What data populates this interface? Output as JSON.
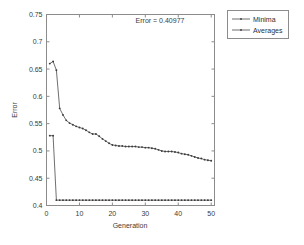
{
  "chart_data": {
    "type": "line",
    "title": "",
    "xlabel": "Generation",
    "ylabel": "Error",
    "xlim": [
      0,
      51
    ],
    "ylim": [
      0.4,
      0.75
    ],
    "xticks": [
      0,
      10,
      20,
      30,
      40,
      50
    ],
    "xtick_labels": [
      "0",
      "10",
      "20",
      "30",
      "40",
      "50"
    ],
    "yticks": [
      0.4,
      0.45,
      0.5,
      0.55,
      0.6,
      0.65,
      0.7,
      0.75
    ],
    "ytick_labels": [
      "0.4",
      "0.45",
      "0.5",
      "0.55",
      "0.6",
      "0.65",
      "0.7",
      "0.75"
    ],
    "grid": false,
    "legend_position": "outside-top-right",
    "annotations": [
      {
        "text": "Error = 0.40977",
        "x": 22,
        "y": 0.738
      }
    ],
    "x": [
      1,
      2,
      3,
      4,
      5,
      6,
      7,
      8,
      9,
      10,
      11,
      12,
      13,
      14,
      15,
      16,
      17,
      18,
      19,
      20,
      21,
      22,
      23,
      24,
      25,
      26,
      27,
      28,
      29,
      30,
      31,
      32,
      33,
      34,
      35,
      36,
      37,
      38,
      39,
      40,
      41,
      42,
      43,
      44,
      45,
      46,
      47,
      48,
      49,
      50
    ],
    "series": [
      {
        "name": "Minima",
        "marker": "point",
        "values": [
          0.528,
          0.528,
          0.4098,
          0.4098,
          0.4098,
          0.4098,
          0.4098,
          0.4098,
          0.4098,
          0.4098,
          0.4098,
          0.4098,
          0.4098,
          0.4098,
          0.4098,
          0.4098,
          0.4098,
          0.4098,
          0.4098,
          0.4098,
          0.4098,
          0.4098,
          0.4098,
          0.4098,
          0.4098,
          0.4098,
          0.4098,
          0.4098,
          0.4098,
          0.4098,
          0.4098,
          0.4098,
          0.4098,
          0.4098,
          0.4098,
          0.4098,
          0.4098,
          0.4098,
          0.4098,
          0.4098,
          0.4098,
          0.4098,
          0.4098,
          0.4098,
          0.4098,
          0.4098,
          0.4098,
          0.4098,
          0.4098,
          0.4098
        ]
      },
      {
        "name": "Averages",
        "marker": "point",
        "values": [
          0.66,
          0.664,
          0.648,
          0.578,
          0.566,
          0.556,
          0.551,
          0.548,
          0.545,
          0.543,
          0.541,
          0.538,
          0.534,
          0.531,
          0.531,
          0.527,
          0.522,
          0.518,
          0.514,
          0.511,
          0.51,
          0.509,
          0.509,
          0.508,
          0.508,
          0.508,
          0.508,
          0.507,
          0.507,
          0.506,
          0.506,
          0.505,
          0.504,
          0.502,
          0.5,
          0.499,
          0.499,
          0.499,
          0.498,
          0.497,
          0.495,
          0.494,
          0.493,
          0.491,
          0.489,
          0.487,
          0.486,
          0.484,
          0.483,
          0.482
        ]
      }
    ]
  },
  "legend": {
    "entries": [
      {
        "label": "Minima"
      },
      {
        "label": "Averages"
      }
    ]
  },
  "axes": {
    "x_title": "Generation",
    "y_title": "Error"
  },
  "annotation": {
    "error_label": "Error = 0.40977"
  }
}
